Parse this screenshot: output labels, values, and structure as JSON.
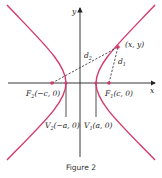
{
  "figure": {
    "caption": "Figure 2",
    "colors": {
      "curve": "#d63a6a",
      "axis": "#222222",
      "dashed": "#222222"
    },
    "axes": {
      "x_label": "x",
      "y_label": "y"
    },
    "labels": {
      "point": "(x, y)",
      "d1": "d",
      "d1_sub": "1",
      "d2": "d",
      "d2_sub": "2",
      "f1": "F",
      "f1_sub": "1",
      "f1_coord": "(c, 0)",
      "f2": "F",
      "f2_sub": "2",
      "f2_coord": "(−c, 0)",
      "v1": "V",
      "v1_sub": "1",
      "v1_coord": "(a, 0)",
      "v2": "V",
      "v2_sub": "2",
      "v2_coord": "(−a, 0)"
    }
  }
}
